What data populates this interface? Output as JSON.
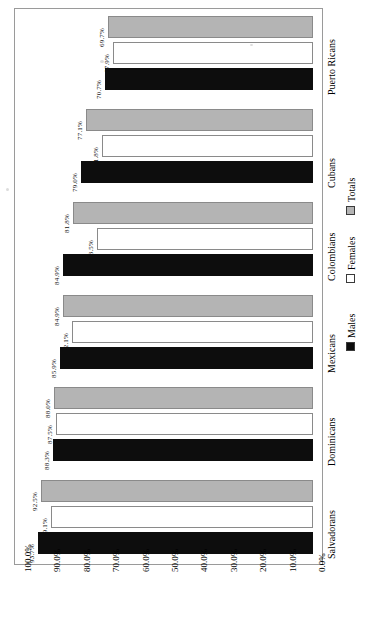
{
  "chart_data": {
    "type": "bar",
    "orientation": "rotated-90",
    "title": "",
    "subtitle": "",
    "xlabel": "",
    "ylabel": "",
    "grid": false,
    "legend_position": "right",
    "axis_ticks": [
      "100.0%",
      "90.0%",
      "80.0%",
      "70.0%",
      "60.0%",
      "50.0%",
      "40.0%",
      "30.0%",
      "20.0%",
      "10.0%",
      "0.0%"
    ],
    "ylim": [
      0,
      100
    ],
    "categories": [
      "Salvadorans",
      "Dominicans",
      "Mexicans",
      "Colombians",
      "Cubans",
      "Puerto Ricans"
    ],
    "series": [
      {
        "name": "Males",
        "color": "#0d0d0d",
        "values": [
          93.7,
          88.3,
          85.9,
          84.9,
          79.0,
          70.7
        ],
        "labels": [
          "93.7%",
          "88.3%",
          "85.9%",
          "84.9%",
          "79.0%",
          "70.7%"
        ]
      },
      {
        "name": "Females",
        "color": "#ffffff",
        "values": [
          89.1,
          87.5,
          82.1,
          73.5,
          71.8,
          67.9
        ],
        "labels": [
          "89.1%",
          "87.5%",
          "82.1%",
          "73.5%",
          "71.8%",
          "67.9%"
        ]
      },
      {
        "name": "Totals",
        "color": "#b4b4b4",
        "values": [
          92.5,
          88.0,
          84.9,
          81.8,
          77.1,
          69.7
        ],
        "labels": [
          "92.5%",
          "88.0%",
          "84.9%",
          "81.8%",
          "77.1%",
          "69.7%"
        ]
      }
    ],
    "legend": [
      {
        "label": "Males",
        "color": "#0d0d0d"
      },
      {
        "label": "Females",
        "color": "#ffffff"
      },
      {
        "label": "Totals",
        "color": "#b4b4b4"
      }
    ]
  }
}
